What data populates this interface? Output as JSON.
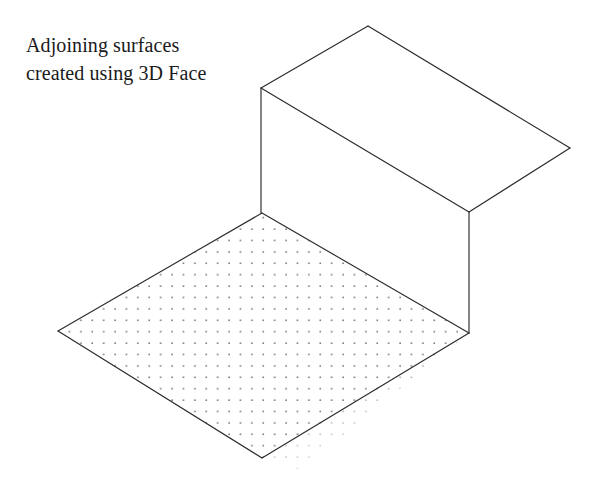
{
  "page": {
    "background_color": "#ffffff",
    "width": 605,
    "height": 497
  },
  "annotation": {
    "label": "Adjoining surfaces created using 3D Face",
    "line_1": "Adjoining surfaces",
    "line_2": "created using 3D",
    "line_3": "Face",
    "color": "#1a1a1a",
    "font_size_px": 20
  },
  "figure": {
    "line_color": "#2b2b2b",
    "line_width": 1.15,
    "hatch_dot_color": "#6b6b6b",
    "surfaces": [
      {
        "name": "top-face",
        "description": "Upper horizontal 3D Face",
        "filled": false,
        "hatched": false,
        "points": "368,26 570,148 469,212 261,88"
      },
      {
        "name": "wall-face",
        "description": "Vertical 3D Face",
        "filled": false,
        "hatched": false,
        "points": "261,88 469,212 469,333 261,213"
      },
      {
        "name": "floor-face",
        "description": "Lower horizontal 3D Face with dot hatch",
        "filled": false,
        "hatched": true,
        "points": "262,213 469,333 262,458 58,331"
      }
    ],
    "edges": [
      {
        "name": "top-face-back-left-edge",
        "d": "M 261,88 L 368,26"
      },
      {
        "name": "top-face-back-right-edge",
        "d": "M 368,26 L 570,148"
      },
      {
        "name": "top-face-front-right-edge",
        "d": "M 570,148 L 469,212"
      },
      {
        "name": "top-face-front-left-edge",
        "d": "M 469,212 L 261,88"
      },
      {
        "name": "wall-left-vertical-edge",
        "d": "M 261,88 L 261,213"
      },
      {
        "name": "wall-right-vertical-edge",
        "d": "M 469,212 L 469,333"
      },
      {
        "name": "floor-back-left-edge",
        "d": "M 262,213 L 58,331"
      },
      {
        "name": "floor-back-right-edge",
        "d": "M 262,213 L 469,333"
      },
      {
        "name": "floor-front-left-edge",
        "d": "M 58,331 L 262,458"
      },
      {
        "name": "floor-front-right-edge",
        "d": "M 262,458 L 469,333"
      }
    ],
    "hatch": {
      "name": "dot-hatch-pattern",
      "spacing_x_px": 11.4,
      "spacing_y_px": 11.4,
      "dot_radius_px": 0.85,
      "overflow": "pattern extends past the front-right floor edge and fades"
    }
  }
}
